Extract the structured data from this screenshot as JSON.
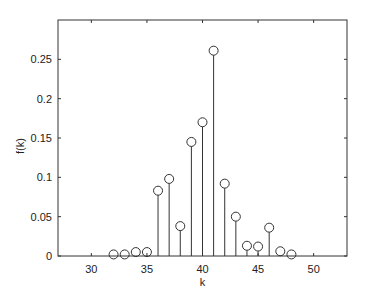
{
  "chart_data": {
    "type": "stem",
    "title": "",
    "xlabel": "k",
    "ylabel": "f(k)",
    "xlim": [
      27,
      53
    ],
    "ylim": [
      0,
      0.3
    ],
    "xticks": [
      30,
      35,
      40,
      45,
      50
    ],
    "xtick_labels": [
      "30",
      "35",
      "40",
      "45",
      "50"
    ],
    "yticks": [
      0,
      0.05,
      0.1,
      0.15,
      0.2,
      0.25
    ],
    "ytick_labels": [
      "0",
      "0.05",
      "0.1",
      "0.15",
      "0.2",
      "0.25"
    ],
    "grid": false,
    "legend": null,
    "marker": "open-circle",
    "color": "#333333",
    "x": [
      32,
      33,
      34,
      35,
      36,
      37,
      38,
      39,
      40,
      41,
      42,
      43,
      44,
      45,
      46,
      47,
      48
    ],
    "values": [
      0.002,
      0.002,
      0.005,
      0.005,
      0.083,
      0.098,
      0.038,
      0.145,
      0.17,
      0.261,
      0.092,
      0.05,
      0.013,
      0.012,
      0.036,
      0.006,
      0.002
    ]
  }
}
